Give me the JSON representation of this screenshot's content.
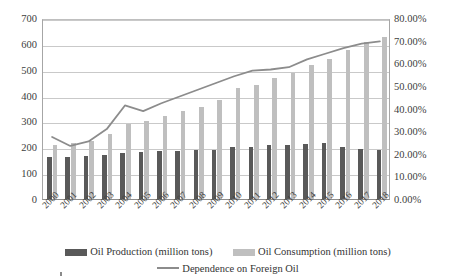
{
  "chart_data": {
    "type": "bar",
    "title": "",
    "subtitle": "",
    "xlabel": "",
    "ylabel": "",
    "y2label": "",
    "grid": true,
    "legend_position": "bottom",
    "categories": [
      "2000",
      "2001",
      "2002",
      "2003",
      "2004",
      "2005",
      "2006",
      "2007",
      "2008",
      "2009",
      "2010",
      "2011",
      "2012",
      "2013",
      "2014",
      "2015",
      "2016",
      "2017",
      "2018"
    ],
    "ylim": [
      0,
      700
    ],
    "yticks": [
      "0",
      "100",
      "200",
      "300",
      "400",
      "500",
      "600",
      "700"
    ],
    "ytick_values": [
      0,
      100,
      200,
      300,
      400,
      500,
      600,
      700
    ],
    "y2lim": [
      0,
      80
    ],
    "y2ticks": [
      "0.00%",
      "10.00%",
      "20.00%",
      "30.00%",
      "40.00%",
      "50.00%",
      "60.00%",
      "70.00%",
      "80.00%"
    ],
    "y2tick_values": [
      0,
      10,
      20,
      30,
      40,
      50,
      60,
      70,
      80
    ],
    "series": [
      {
        "name": "Oil Production (million tons)",
        "type": "bar",
        "axis": "left",
        "color": "#595959",
        "values": [
          163,
          164,
          167,
          170,
          177,
          181,
          185,
          187,
          190,
          190,
          203,
          203,
          207,
          210,
          211,
          215,
          200,
          192,
          190
        ]
      },
      {
        "name": "Oil Consumption (million tons)",
        "type": "bar",
        "axis": "left",
        "color": "#bfbfbf",
        "values": [
          210,
          215,
          225,
          252,
          290,
          300,
          322,
          340,
          355,
          382,
          429,
          440,
          468,
          487,
          518,
          540,
          578,
          608,
          625
        ]
      },
      {
        "name": "Dependence on Foreign Oil",
        "type": "line",
        "axis": "right",
        "color": "#8c8c8c",
        "values": [
          28.0,
          24.0,
          26.0,
          31.5,
          42.0,
          39.5,
          43.0,
          46.0,
          49.0,
          52.0,
          55.0,
          57.5,
          58.0,
          59.0,
          62.5,
          65.0,
          67.5,
          69.5,
          70.5
        ]
      }
    ],
    "legend": [
      "Oil Production (million tons)",
      "Oil Consumption (million tons)",
      "Dependence on Foreign Oil"
    ],
    "colors": {
      "production": "#595959",
      "consumption": "#bfbfbf",
      "dependence": "#8c8c8c",
      "gridline": "#c9c9c9",
      "axis": "#8c8c8c",
      "background": "#ffffff",
      "text": "#404040"
    }
  }
}
